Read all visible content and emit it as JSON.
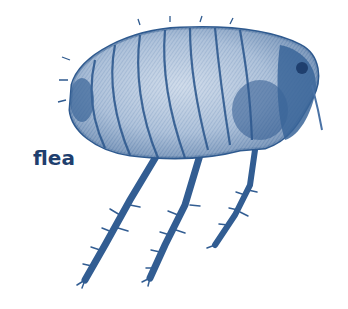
{
  "figure": {
    "label": "flea",
    "colors": {
      "ink": "#2f5a8f",
      "ink_dark": "#1f3f6e",
      "ink_light": "#8ea9c9",
      "background": "#ffffff"
    }
  }
}
